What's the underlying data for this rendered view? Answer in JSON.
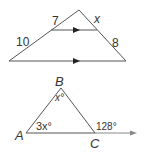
{
  "figure1": {
    "label_top_left": "7",
    "label_top_right": "x",
    "label_bottom_left": "10",
    "label_bottom_right": "8",
    "line_color": "#555555",
    "arrow_color": "#222222"
  },
  "figure2": {
    "vertex_a": "A",
    "vertex_b": "B",
    "vertex_c": "C",
    "angle_a": "3x°",
    "angle_b": "x°",
    "exterior_angle_c": "128°",
    "line_color": "#555555",
    "ray_color": "#888888"
  }
}
